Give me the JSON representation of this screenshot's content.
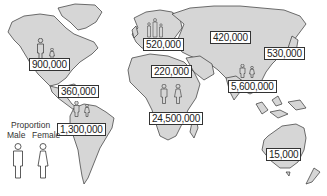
{
  "map": {
    "type": "world-map",
    "land_color": "#d6d6d6",
    "outline_color": "#333333",
    "regions": [
      {
        "name": "North America",
        "value": "900,000",
        "male_proportion": "larger",
        "female_proportion": "smaller"
      },
      {
        "name": "Central America / Caribbean",
        "value": "360,000"
      },
      {
        "name": "South America",
        "value": "1,300,000",
        "male_proportion": "larger",
        "female_proportion": "smaller"
      },
      {
        "name": "Western Europe",
        "value": "520,000"
      },
      {
        "name": "North Africa / Middle East",
        "value": "220,000"
      },
      {
        "name": "Eastern Europe / Central Asia",
        "value": "420,000"
      },
      {
        "name": "East Asia",
        "value": "530,000"
      },
      {
        "name": "South / Southeast Asia",
        "value": "5,600,000",
        "male_proportion": "larger",
        "female_proportion": "smaller"
      },
      {
        "name": "Sub-Saharan Africa",
        "value": "24,500,000",
        "male_proportion": "equal",
        "female_proportion": "equal"
      },
      {
        "name": "Australia / New Zealand",
        "value": "15,000"
      }
    ]
  },
  "legend": {
    "title": "Proportion",
    "male_label": "Male",
    "female_label": "Female"
  }
}
